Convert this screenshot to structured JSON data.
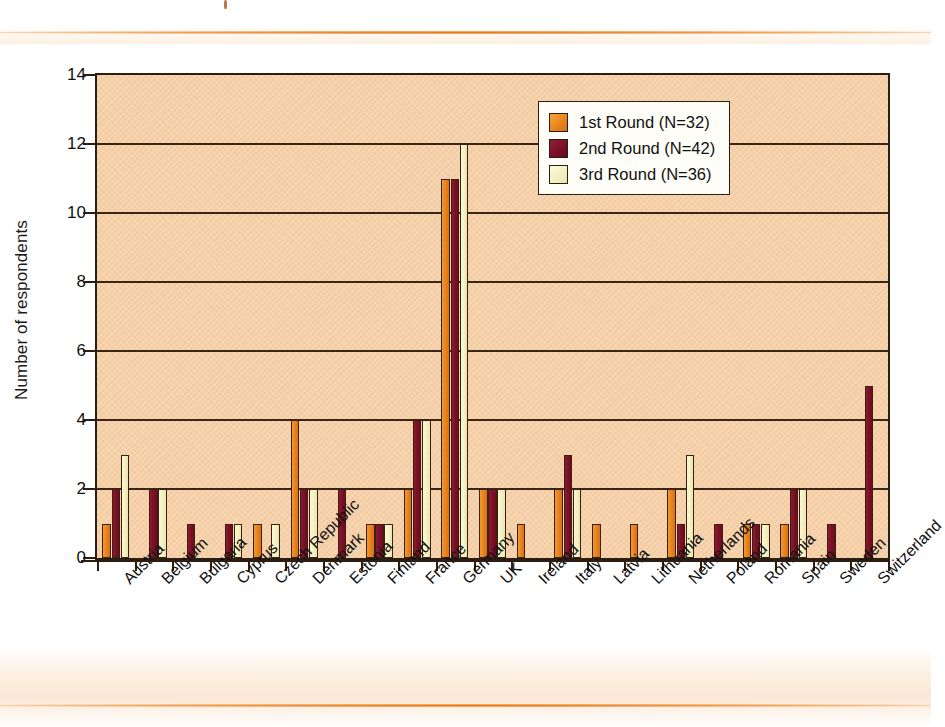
{
  "chart_data": {
    "type": "bar",
    "title": "",
    "xlabel": "",
    "ylabel": "Number of respondents",
    "ylim": [
      0,
      14
    ],
    "ytick_values": [
      0,
      2,
      4,
      6,
      8,
      10,
      12,
      14
    ],
    "grid": true,
    "legend_position": "top-right",
    "categories": [
      "Austria",
      "Belgium",
      "Bulgaria",
      "Cyprus",
      "Czech Republic",
      "Denmark",
      "Estonia",
      "Finland",
      "France",
      "Germany",
      "UK",
      "Ireland",
      "Italy",
      "Latvia",
      "Lithuania",
      "Netherlands",
      "Poland",
      "Romania",
      "Spain",
      "Sweden",
      "Switzerland"
    ],
    "series": [
      {
        "name": "1st Round (N=32)",
        "color": "#E8811A",
        "values": [
          1,
          0,
          0,
          0,
          1,
          4,
          0,
          1,
          2,
          11,
          2,
          1,
          2,
          1,
          1,
          2,
          0,
          1,
          1,
          0,
          0
        ]
      },
      {
        "name": "2nd Round (N=42)",
        "color": "#7A0F26",
        "values": [
          2,
          2,
          1,
          1,
          0,
          2,
          2,
          1,
          4,
          11,
          2,
          0,
          3,
          0,
          0,
          1,
          1,
          1,
          2,
          1,
          5
        ]
      },
      {
        "name": "3rd Round (N=36)",
        "color": "#F3EFC0",
        "values": [
          3,
          2,
          0,
          1,
          1,
          2,
          0,
          1,
          4,
          12,
          2,
          0,
          2,
          0,
          0,
          3,
          0,
          1,
          2,
          0,
          0
        ]
      }
    ]
  },
  "legend": {
    "items": [
      {
        "label": "1st Round (N=32)"
      },
      {
        "label": "2nd Round (N=42)"
      },
      {
        "label": "3rd Round (N=36)"
      }
    ]
  },
  "axes": {
    "y_title": "Number of respondents",
    "y_ticks": [
      "0",
      "2",
      "4",
      "6",
      "8",
      "10",
      "12",
      "14"
    ]
  },
  "colors": {
    "series_1": "#E8811A",
    "series_2": "#7A0F26",
    "series_3": "#F3EFC0",
    "plot_background": "#F6D1A9",
    "accent_rule": "#E8781D",
    "axis": "#2B1D12"
  }
}
